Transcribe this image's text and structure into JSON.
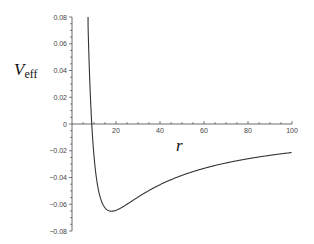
{
  "chart_data": {
    "type": "line",
    "title": "",
    "xlabel": "r",
    "ylabel": "V",
    "ylabel_subscript": "eff",
    "xlim": [
      0,
      100
    ],
    "ylim": [
      -0.08,
      0.08
    ],
    "grid": false,
    "legend": null,
    "x_ticks": [
      20,
      40,
      60,
      80,
      100
    ],
    "x_tick_labels": [
      "20",
      "40",
      "60",
      "80",
      "100"
    ],
    "y_ticks": [
      0.08,
      0.06,
      0.04,
      0.02,
      0,
      -0.02,
      -0.04,
      -0.06,
      -0.08
    ],
    "y_tick_labels": [
      "0.08",
      "0.06",
      "0.04",
      "0.02",
      "0",
      "−0.02",
      "−0.04",
      "−0.06",
      "−0.08"
    ],
    "formula_fit": "V = 21/r^2 - 2.34/r",
    "series": [
      {
        "name": "Veff",
        "x": [
          7.3,
          8,
          9,
          10,
          11,
          12,
          13,
          14,
          15,
          16,
          17,
          18,
          19,
          20,
          22,
          24,
          26,
          28,
          30,
          35,
          40,
          45,
          50,
          55,
          60,
          65,
          70,
          75,
          80,
          85,
          90,
          95,
          100
        ],
        "y": [
          0.0735,
          0.0356,
          0.0033,
          -0.024,
          -0.0392,
          -0.0492,
          -0.0558,
          -0.06,
          -0.0627,
          -0.0642,
          -0.065,
          -0.0652,
          -0.065,
          -0.0645,
          -0.063,
          -0.061,
          -0.0589,
          -0.0568,
          -0.0547,
          -0.0497,
          -0.0454,
          -0.0416,
          -0.0384,
          -0.0356,
          -0.0332,
          -0.031,
          -0.0291,
          -0.0275,
          -0.026,
          -0.0246,
          -0.0234,
          -0.0223,
          -0.0213
        ]
      }
    ],
    "annotations": {
      "zero_crossing_r": 9,
      "minimum": {
        "r": 18,
        "V": -0.065
      }
    }
  },
  "labels": {
    "y_main": "V",
    "y_sub": "eff",
    "x": "r"
  }
}
